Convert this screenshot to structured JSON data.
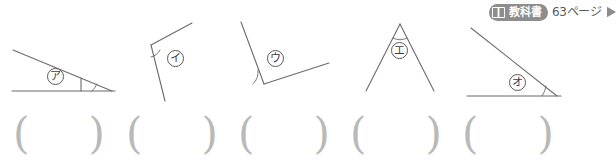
{
  "badge": {
    "icon": "open-book-icon",
    "label": "教科書",
    "page": "63ページ",
    "arrow_icon": "play-arrow-icon",
    "pill_color": "#8d8d8d",
    "text_color": "#5a5a5a"
  },
  "figures": [
    {
      "id": "figure-1",
      "label": "ア",
      "description": "thin triangle, marked angle at lower-right vertex"
    },
    {
      "id": "figure-2",
      "label": "イ",
      "description": "two rays meeting at upper-left vertex, angle opens to the right"
    },
    {
      "id": "figure-3",
      "label": "ウ",
      "description": "two rays meeting at lower-left vertex, wide angle"
    },
    {
      "id": "figure-4",
      "label": "エ",
      "description": "inverted V, narrow angle at the apex"
    },
    {
      "id": "figure-5",
      "label": "オ",
      "description": "right triangle, marked angle at lower-right vertex"
    }
  ],
  "answers": [
    {
      "id": "answer-1",
      "open": "(",
      "close": ")",
      "value": ""
    },
    {
      "id": "answer-2",
      "open": "(",
      "close": ")",
      "value": ""
    },
    {
      "id": "answer-3",
      "open": "(",
      "close": ")",
      "value": ""
    },
    {
      "id": "answer-4",
      "open": "(",
      "close": ")",
      "value": ""
    },
    {
      "id": "answer-5",
      "open": "(",
      "close": ")",
      "value": ""
    }
  ],
  "style": {
    "stroke": "#6b6b6b",
    "paren_color": "#b9b9b9"
  }
}
